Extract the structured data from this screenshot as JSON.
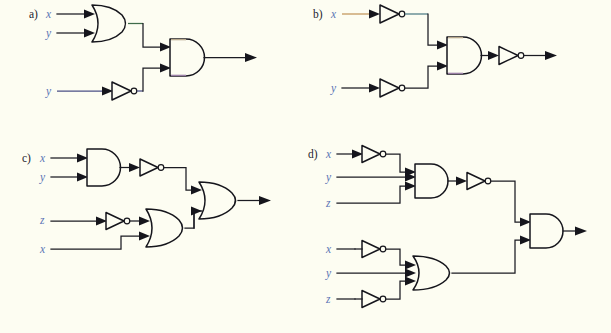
{
  "figure": {
    "background_color": "#fdfdf2",
    "wire_color": "#1b1b22",
    "gate_outline_color": "#15151c",
    "label_color": "#23232c",
    "signal_label_color": "#5b74b5"
  },
  "panels": [
    {
      "id": "a",
      "label": "a)",
      "inputs": [
        {
          "name": "x",
          "label": "x",
          "row": 0
        },
        {
          "name": "y",
          "label": "y",
          "row": 1
        },
        {
          "name": "y2",
          "label": "y",
          "row": 2
        }
      ],
      "gates": [
        {
          "id": "a-or1",
          "type": "OR",
          "inputs_count": 2,
          "name": "or-gate"
        },
        {
          "id": "a-not1",
          "type": "NOT",
          "inputs_count": 1,
          "name": "not-gate"
        },
        {
          "id": "a-and1",
          "type": "AND",
          "inputs_count": 2,
          "name": "and-gate"
        }
      ],
      "output": {
        "name": "output-arrow",
        "label": ""
      }
    },
    {
      "id": "b",
      "label": "b)",
      "inputs": [
        {
          "name": "x",
          "label": "x",
          "row": 0
        },
        {
          "name": "y",
          "label": "y",
          "row": 1
        }
      ],
      "gates": [
        {
          "id": "b-not1",
          "type": "NOT",
          "inputs_count": 1,
          "name": "not-gate"
        },
        {
          "id": "b-not2",
          "type": "NOT",
          "inputs_count": 1,
          "name": "not-gate"
        },
        {
          "id": "b-and1",
          "type": "AND",
          "inputs_count": 2,
          "name": "and-gate"
        },
        {
          "id": "b-not3",
          "type": "NOT",
          "inputs_count": 1,
          "name": "not-gate"
        }
      ],
      "output": {
        "name": "output-arrow",
        "label": ""
      }
    },
    {
      "id": "c",
      "label": "c)",
      "inputs": [
        {
          "name": "x",
          "label": "x",
          "row": 0
        },
        {
          "name": "y",
          "label": "y",
          "row": 1
        },
        {
          "name": "z",
          "label": "z",
          "row": 2
        },
        {
          "name": "x2",
          "label": "x",
          "row": 3
        }
      ],
      "gates": [
        {
          "id": "c-and1",
          "type": "AND",
          "inputs_count": 2,
          "name": "and-gate"
        },
        {
          "id": "c-not1",
          "type": "NOT",
          "inputs_count": 1,
          "name": "not-gate"
        },
        {
          "id": "c-not2",
          "type": "NOT",
          "inputs_count": 1,
          "name": "not-gate"
        },
        {
          "id": "c-or1",
          "type": "OR",
          "inputs_count": 2,
          "name": "or-gate"
        },
        {
          "id": "c-or2",
          "type": "OR",
          "inputs_count": 2,
          "name": "or-gate"
        }
      ],
      "output": {
        "name": "output-arrow",
        "label": ""
      }
    },
    {
      "id": "d",
      "label": "d)",
      "inputs": [
        {
          "name": "x",
          "label": "x",
          "row": 0
        },
        {
          "name": "y",
          "label": "y",
          "row": 1
        },
        {
          "name": "z",
          "label": "z",
          "row": 2
        },
        {
          "name": "x2",
          "label": "x",
          "row": 3
        },
        {
          "name": "y2",
          "label": "y",
          "row": 4
        },
        {
          "name": "z2",
          "label": "z",
          "row": 5
        }
      ],
      "gates": [
        {
          "id": "d-not1",
          "type": "NOT",
          "inputs_count": 1,
          "name": "not-gate"
        },
        {
          "id": "d-and1",
          "type": "AND",
          "inputs_count": 3,
          "name": "and-gate"
        },
        {
          "id": "d-not2",
          "type": "NOT",
          "inputs_count": 1,
          "name": "not-gate"
        },
        {
          "id": "d-not3",
          "type": "NOT",
          "inputs_count": 1,
          "name": "not-gate"
        },
        {
          "id": "d-not4",
          "type": "NOT",
          "inputs_count": 1,
          "name": "not-gate"
        },
        {
          "id": "d-or1",
          "type": "OR",
          "inputs_count": 3,
          "name": "or-gate"
        },
        {
          "id": "d-and2",
          "type": "AND",
          "inputs_count": 2,
          "name": "and-gate"
        }
      ],
      "output": {
        "name": "output-arrow",
        "label": ""
      }
    }
  ],
  "labels": {
    "a": "a)",
    "b": "b)",
    "c": "c)",
    "d": "d)",
    "a_x": "x",
    "a_y": "y",
    "a_y2": "y",
    "b_x": "x",
    "b_y": "y",
    "c_x": "x",
    "c_y": "y",
    "c_z": "z",
    "c_x2": "x",
    "d_x": "x",
    "d_y": "y",
    "d_z": "z",
    "d_x2": "x",
    "d_y2": "y",
    "d_z2": "z"
  }
}
